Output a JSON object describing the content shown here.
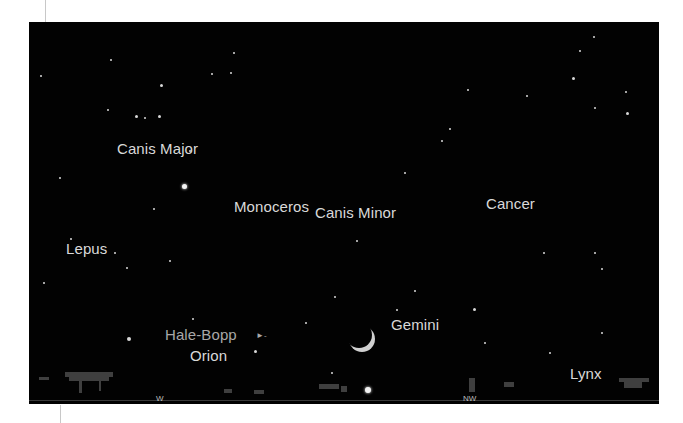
{
  "sky_chart": {
    "background": "#020202",
    "constellations": [
      {
        "name": "Canis Major",
        "x": 88,
        "y": 119
      },
      {
        "name": "Monoceros",
        "x": 205,
        "y": 177
      },
      {
        "name": "Canis Minor",
        "x": 286,
        "y": 183
      },
      {
        "name": "Cancer",
        "x": 457,
        "y": 174
      },
      {
        "name": "Lepus",
        "x": 37,
        "y": 219
      },
      {
        "name": "Orion",
        "x": 161,
        "y": 326
      },
      {
        "name": "Gemini",
        "x": 362,
        "y": 295
      },
      {
        "name": "Lynx",
        "x": 541,
        "y": 344
      }
    ],
    "comet": {
      "name": "Hale-Bopp",
      "marker": "►-",
      "x": 136,
      "y": 305
    },
    "compass": [
      {
        "label": "W",
        "x": 127,
        "y": 373
      },
      {
        "label": "NW",
        "x": 434,
        "y": 373
      }
    ],
    "moon": {
      "phase": "crescent",
      "x": 320,
      "y": 302
    },
    "bright_objects": [
      {
        "name": "sirius",
        "x": 155,
        "y": 164,
        "size": 5
      },
      {
        "name": "horizon-planet",
        "x": 336,
        "y": 365,
        "size": 6
      }
    ]
  }
}
